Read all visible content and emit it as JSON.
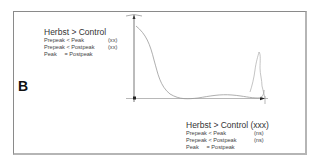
{
  "panel": {
    "letter": "B"
  },
  "legend_top": {
    "title": "Herbst > Control",
    "rows": [
      {
        "comparison": "Prepeak < Peak",
        "significance": "(xx)"
      },
      {
        "comparison": "Prepeak < Postpeak",
        "significance": "(xx)"
      },
      {
        "comparison": "Peak     = Postpeak",
        "significance": ""
      }
    ]
  },
  "legend_bottom": {
    "title": "Herbst > Control (xxx)",
    "rows": [
      {
        "comparison": "Prepeak < Peak",
        "significance": "(ns)"
      },
      {
        "comparison": "Prepeak < Postpeak",
        "significance": "(ns)"
      },
      {
        "comparison": "Peak     = Postpeak",
        "significance": ""
      }
    ]
  },
  "colors": {
    "frame": "#8a8a8a",
    "axis": "#555555",
    "curve": "#9a9a9a",
    "text": "#333333"
  }
}
